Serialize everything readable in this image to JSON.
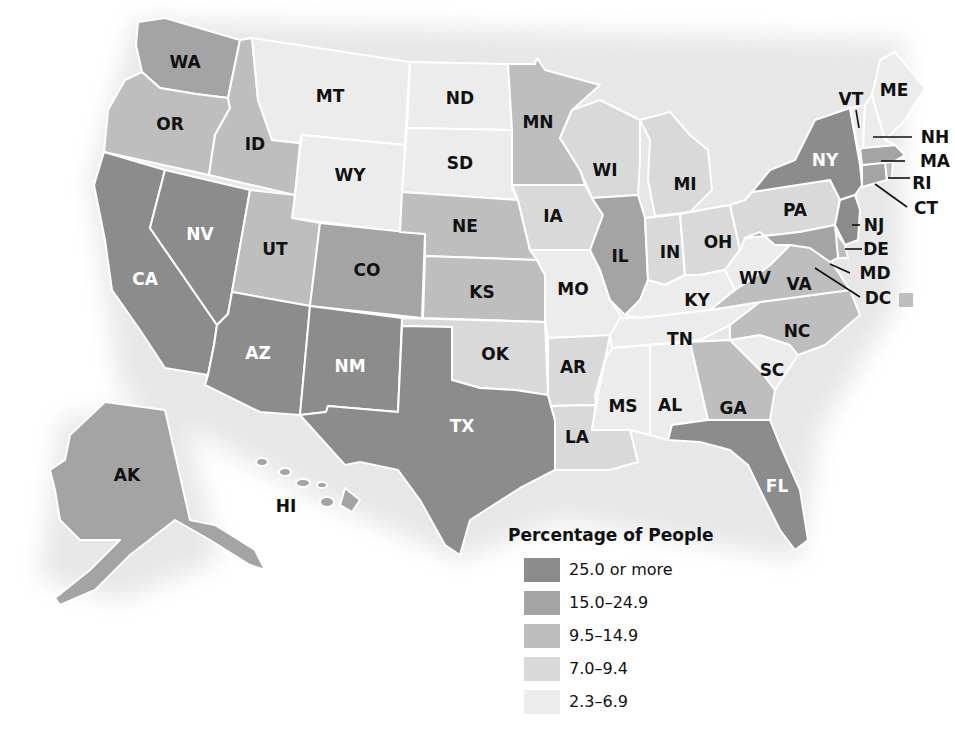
{
  "legend": {
    "title": "Percentage of People",
    "classes": [
      {
        "label": "25.0 or more",
        "color": "#8c8c8c"
      },
      {
        "label": "15.0–24.9",
        "color": "#a4a4a4"
      },
      {
        "label": "9.5–14.9",
        "color": "#bebebe"
      },
      {
        "label": "7.0–9.4",
        "color": "#d9d9d9"
      },
      {
        "label": "2.3–6.9",
        "color": "#ececec"
      }
    ]
  },
  "states": {
    "WA": {
      "label": "WA",
      "class": 1
    },
    "OR": {
      "label": "OR",
      "class": 2
    },
    "CA": {
      "label": "CA",
      "class": 0
    },
    "NV": {
      "label": "NV",
      "class": 0
    },
    "ID": {
      "label": "ID",
      "class": 2
    },
    "MT": {
      "label": "MT",
      "class": 4
    },
    "WY": {
      "label": "WY",
      "class": 4
    },
    "UT": {
      "label": "UT",
      "class": 2
    },
    "AZ": {
      "label": "AZ",
      "class": 0
    },
    "CO": {
      "label": "CO",
      "class": 1
    },
    "NM": {
      "label": "NM",
      "class": 0
    },
    "ND": {
      "label": "ND",
      "class": 4
    },
    "SD": {
      "label": "SD",
      "class": 4
    },
    "NE": {
      "label": "NE",
      "class": 2
    },
    "KS": {
      "label": "KS",
      "class": 2
    },
    "OK": {
      "label": "OK",
      "class": 3
    },
    "TX": {
      "label": "TX",
      "class": 0
    },
    "MN": {
      "label": "MN",
      "class": 2
    },
    "IA": {
      "label": "IA",
      "class": 3
    },
    "MO": {
      "label": "MO",
      "class": 4
    },
    "AR": {
      "label": "AR",
      "class": 3
    },
    "LA": {
      "label": "LA",
      "class": 3
    },
    "WI": {
      "label": "WI",
      "class": 3
    },
    "IL": {
      "label": "IL",
      "class": 1
    },
    "MI": {
      "label": "MI",
      "class": 3
    },
    "IN": {
      "label": "IN",
      "class": 3
    },
    "OH": {
      "label": "OH",
      "class": 3
    },
    "KY": {
      "label": "KY",
      "class": 4
    },
    "TN": {
      "label": "TN",
      "class": 4
    },
    "MS": {
      "label": "MS",
      "class": 4
    },
    "AL": {
      "label": "AL",
      "class": 4
    },
    "GA": {
      "label": "GA",
      "class": 2
    },
    "FL": {
      "label": "FL",
      "class": 0
    },
    "SC": {
      "label": "SC",
      "class": 4
    },
    "NC": {
      "label": "NC",
      "class": 2
    },
    "VA": {
      "label": "VA",
      "class": 2
    },
    "WV": {
      "label": "WV",
      "class": 4
    },
    "PA": {
      "label": "PA",
      "class": 3
    },
    "NY": {
      "label": "NY",
      "class": 0
    },
    "NJ": {
      "label": "NJ",
      "class": 0
    },
    "DE": {
      "label": "DE",
      "class": 2
    },
    "MD": {
      "label": "MD",
      "class": 1
    },
    "DC": {
      "label": "DC",
      "class": 2
    },
    "CT": {
      "label": "CT",
      "class": 1
    },
    "RI": {
      "label": "RI",
      "class": 2
    },
    "MA": {
      "label": "MA",
      "class": 1
    },
    "VT": {
      "label": "VT",
      "class": 4
    },
    "NH": {
      "label": "NH",
      "class": 4
    },
    "ME": {
      "label": "ME",
      "class": 4
    },
    "AK": {
      "label": "AK",
      "class": 1
    },
    "HI": {
      "label": "HI",
      "class": 1
    }
  }
}
